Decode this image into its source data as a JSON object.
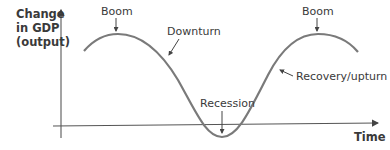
{
  "diagram": {
    "y_axis_label": [
      "Change",
      "in GDP",
      "(output)"
    ],
    "x_axis_label": "Time",
    "labels": {
      "boom_left": "Boom",
      "downturn": "Downturn",
      "recession": "Recession",
      "recovery": "Recovery/upturn",
      "boom_right": "Boom"
    },
    "colors": {
      "curve": "#7a7a7a",
      "axis": "#555555",
      "text": "#3a3a3a"
    }
  }
}
